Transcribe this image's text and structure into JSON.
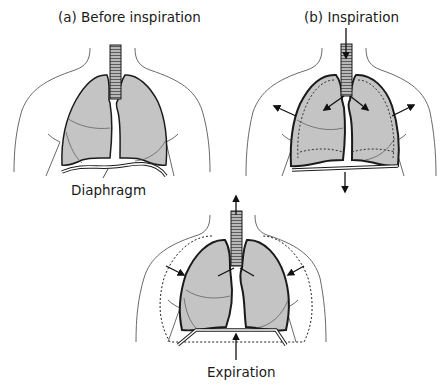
{
  "panels": {
    "a": {
      "title": "(a) Before inspiration",
      "diaphragm_label": "Diaphragm"
    },
    "b": {
      "title": "(b) Inspiration"
    },
    "c": {
      "title": "Expiration"
    }
  },
  "colors": {
    "lung_fill": "#c4c4c4",
    "outline": "#1a1a1a",
    "body_line": "#6a6a6a"
  }
}
